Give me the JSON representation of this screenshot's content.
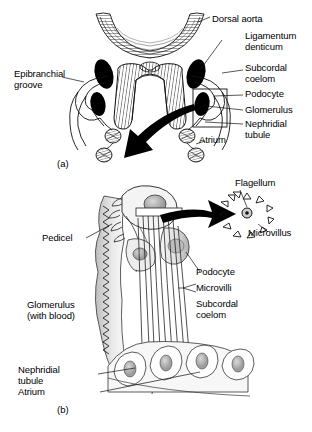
{
  "figure": {
    "background_color": "#ffffff",
    "ink_color": "#000000"
  },
  "panel_a": {
    "id": "(a)",
    "labels": {
      "dorsal_aorta": "Dorsal aorta",
      "ligamentum_denticum": "Ligamentum\ndenticum",
      "subcordal_coelom": "Subcordal\ncoelom",
      "podocyte": "Podocyte",
      "glomerulus": "Glomerulus",
      "nephridial_tubule": "Nephridial\ntubule",
      "atrium": "Atrium",
      "epibranchial_groove": "Epibranchial\ngroove"
    }
  },
  "panel_b": {
    "id": "(b)",
    "labels": {
      "flagellum": "Flagellum",
      "microvillus": "Microvillus",
      "pedicel": "Pedicel",
      "podocyte": "Podocyte",
      "microvilli": "Microvilli",
      "subcordal_coelom": "Subcordal\ncoelom",
      "glomerulus": "Glomerulus\n(with blood)",
      "nephridial_tubule": "Nephridial\ntubule",
      "atrium": "Atrium"
    },
    "inset": {
      "microvillus_count": 12,
      "flagellum_shape": "circle-with-dot"
    }
  }
}
